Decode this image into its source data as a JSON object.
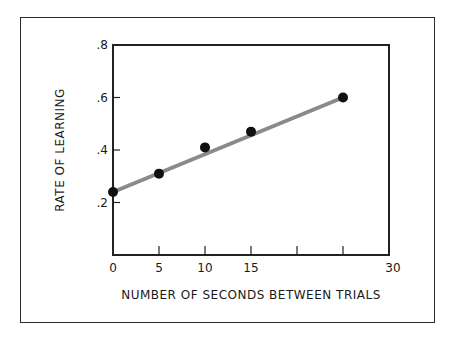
{
  "chart_data": {
    "type": "scatter",
    "title": "",
    "xlabel": "NUMBER OF SECONDS BETWEEN TRIALS",
    "ylabel": "RATE OF LEARNING",
    "xlim": [
      0,
      30
    ],
    "ylim": [
      0,
      0.8
    ],
    "x_ticks": [
      0,
      5,
      10,
      15,
      20,
      25,
      30
    ],
    "x_tick_labels": [
      "0",
      "5",
      "10",
      "15",
      "",
      "",
      "30"
    ],
    "y_ticks": [
      0.2,
      0.4,
      0.6,
      0.8
    ],
    "y_tick_labels": [
      ".2",
      ".4",
      ".6",
      ".8"
    ],
    "grid": false,
    "legend": null,
    "series": [
      {
        "name": "observed",
        "x": [
          0,
          5,
          10,
          15,
          25
        ],
        "y": [
          0.24,
          0.31,
          0.41,
          0.47,
          0.6
        ],
        "marker": "circle",
        "color": "#111111"
      }
    ],
    "trend_line": {
      "x": [
        0,
        25
      ],
      "y": [
        0.24,
        0.6
      ],
      "color": "#8a8a8a"
    }
  },
  "labels": {
    "xlabel": "NUMBER OF SECONDS BETWEEN TRIALS",
    "ylabel": "RATE OF LEARNING"
  }
}
